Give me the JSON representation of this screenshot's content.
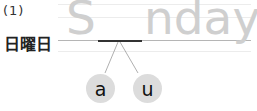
{
  "question": {
    "number": "(1)",
    "japanese_word": "日曜日",
    "word_prefix": "S",
    "word_suffix": "nday",
    "blank": "_",
    "choices": [
      {
        "label": "a"
      },
      {
        "label": "u"
      }
    ]
  },
  "colors": {
    "trace_text": "#cfcfcf",
    "choice_bg": "#dcdcdc",
    "blank_line": "#333333"
  }
}
